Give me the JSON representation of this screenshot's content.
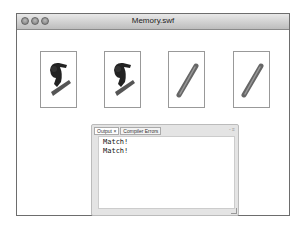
{
  "window": {
    "title": "Memory.swf",
    "controls": [
      "close",
      "minimize",
      "zoom"
    ]
  },
  "cards": [
    {
      "image": "snowboarder-icon",
      "state": "face-up"
    },
    {
      "image": "snowboarder-icon",
      "state": "face-up"
    },
    {
      "image": "pipe-stick-icon",
      "state": "face-up"
    },
    {
      "image": "pipe-stick-icon",
      "state": "face-up"
    }
  ],
  "output_panel": {
    "tabs": [
      {
        "label": "Output ×",
        "active": true
      },
      {
        "label": "Compiler Errors",
        "active": false
      }
    ],
    "controls": "- ≡",
    "lines": [
      "Match!",
      "Match!"
    ]
  }
}
